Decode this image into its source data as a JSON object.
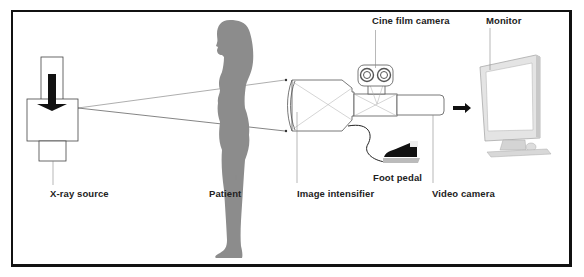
{
  "figure": {
    "components": {
      "xray_source": "X-ray source",
      "patient": "Patient",
      "image_intensifier": "Image intensifier",
      "cine_film_camera": "Cine film camera",
      "foot_pedal": "Foot pedal",
      "video_camera": "Video camera",
      "monitor": "Monitor"
    }
  },
  "colors": {
    "frame": "#111111",
    "silhouette": "#8c8c8c",
    "lines": "#555555",
    "monitor_body": "#e4e4e4",
    "arrow": "#111111"
  }
}
